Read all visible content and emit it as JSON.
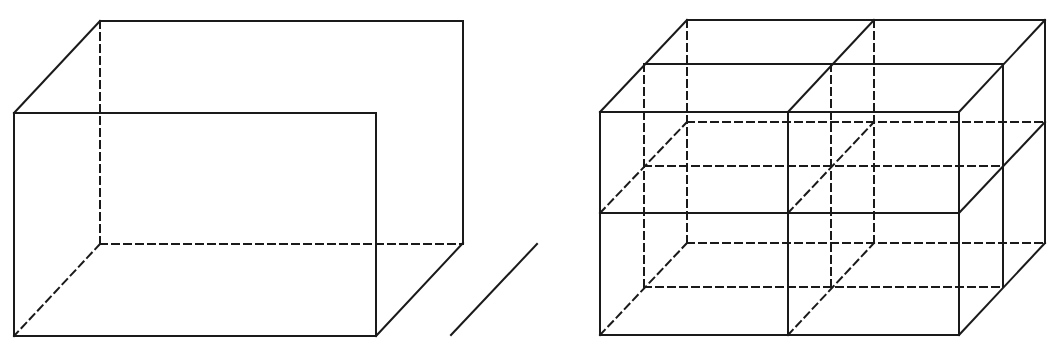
{
  "title": "Rectangular box and box divided into 2x2x2 cells",
  "style": {
    "stroke": "#1a1a1a",
    "background": "#ffffff",
    "stroke_width": 2,
    "dash": "7,5"
  },
  "figures": [
    {
      "name": "single-box",
      "description": "Cuboid with hidden edges dashed",
      "solid": [
        [
          14,
          113,
          376,
          113
        ],
        [
          376,
          113,
          376,
          336
        ],
        [
          376,
          336,
          14,
          336
        ],
        [
          14,
          336,
          14,
          113
        ],
        [
          14,
          113,
          100,
          21
        ],
        [
          100,
          21,
          463,
          21
        ],
        [
          463,
          21,
          463,
          243
        ],
        [
          463,
          243,
          376,
          336
        ]
      ],
      "dashed": [
        [
          100,
          21,
          100,
          244
        ],
        [
          100,
          244,
          463,
          244
        ],
        [
          100,
          244,
          14,
          336
        ]
      ]
    },
    {
      "name": "stand-alone-line",
      "description": "Separate diagonal line segment",
      "solid": [
        [
          451,
          335,
          537,
          244
        ]
      ],
      "dashed": []
    },
    {
      "name": "divided-box",
      "description": "Cuboid split into 2x2x2 smaller cuboids",
      "solid": [
        [
          600,
          112,
          959,
          112
        ],
        [
          600,
          213,
          959,
          213
        ],
        [
          600,
          335,
          959,
          335
        ],
        [
          600,
          112,
          600,
          335
        ],
        [
          788,
          112,
          788,
          335
        ],
        [
          959,
          112,
          959,
          335
        ],
        [
          600,
          112,
          687,
          20
        ],
        [
          788,
          112,
          874,
          20
        ],
        [
          959,
          112,
          1045,
          20
        ],
        [
          644,
          64,
          1003,
          64
        ],
        [
          687,
          20,
          1045,
          20
        ],
        [
          1003,
          64,
          1003,
          287
        ],
        [
          1045,
          20,
          1045,
          243
        ],
        [
          959,
          213,
          1045,
          122
        ],
        [
          959,
          335,
          1045,
          243
        ]
      ],
      "dashed": [
        [
          644,
          64,
          644,
          287
        ],
        [
          687,
          20,
          687,
          243
        ],
        [
          831,
          64,
          831,
          287
        ],
        [
          874,
          20,
          874,
          243
        ],
        [
          644,
          166,
          1003,
          166
        ],
        [
          687,
          122,
          1045,
          122
        ],
        [
          644,
          287,
          1003,
          287
        ],
        [
          687,
          243,
          1045,
          243
        ],
        [
          600,
          213,
          687,
          122
        ],
        [
          788,
          213,
          874,
          122
        ],
        [
          600,
          335,
          687,
          243
        ],
        [
          788,
          335,
          874,
          243
        ]
      ]
    }
  ]
}
